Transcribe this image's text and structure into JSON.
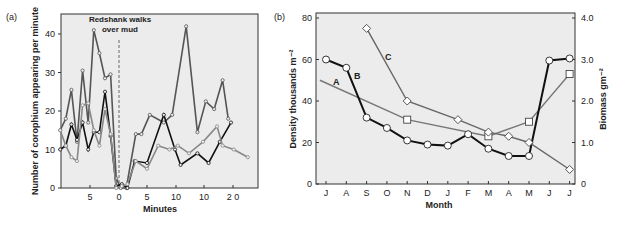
{
  "chart_data": [
    {
      "panel_label": "(a)",
      "type": "line",
      "title": "",
      "xlabel": "Minutes",
      "ylabel": "Number of corophium appearing per minute",
      "ylim": [
        0,
        45
      ],
      "yticks": [
        "0",
        "10",
        "20",
        "30",
        "40"
      ],
      "xticks": [
        "5",
        "0",
        "5",
        "10",
        "10",
        "2 0"
      ],
      "annotation": {
        "line1": "Redshank walks",
        "line2": "over mud",
        "x": 0
      },
      "grid": false,
      "series": [
        {
          "name": "series-1 (dark grey, highest)",
          "color": "#555555",
          "x": [
            -10.5,
            -9.5,
            -8.5,
            -7.5,
            -6.5,
            -5.5,
            -4.5,
            -3.5,
            -2.5,
            -1.5,
            -0.5,
            0.3,
            1.3,
            3,
            4,
            5.5,
            8,
            9.5,
            12,
            14,
            15.5,
            17,
            18.5,
            19.5
          ],
          "y": [
            15,
            18,
            25.5,
            12,
            30.5,
            17,
            41,
            35,
            28.5,
            29.5,
            2.5,
            0,
            0,
            14,
            14,
            19,
            17,
            19,
            42,
            14.5,
            22.5,
            20.5,
            28,
            18
          ]
        },
        {
          "name": "series-2 (black)",
          "color": "#111111",
          "x": [
            -10.5,
            -9.5,
            -8.5,
            -7.5,
            -6.5,
            -5.5,
            -4.5,
            -3.5,
            -2.5,
            -1.5,
            -0.5,
            0.5,
            1.5,
            2.8,
            5,
            8,
            10,
            11,
            14,
            16,
            18,
            20
          ],
          "y": [
            10,
            11,
            16.5,
            12.5,
            17,
            10,
            14.5,
            14.5,
            25,
            13.5,
            0.5,
            1,
            0,
            7,
            6.5,
            19,
            10,
            6,
            9,
            6.5,
            12,
            17
          ]
        },
        {
          "name": "series-3 (light grey)",
          "color": "#888888",
          "x": [
            -10.5,
            -9.5,
            -8.5,
            -7.5,
            -6.5,
            -5.5,
            -4.5,
            -3.5,
            -2.5,
            -1.5,
            -0.5,
            0.5,
            1.5,
            3,
            5,
            7,
            9,
            10.5,
            12.5,
            15,
            17.5,
            18.5,
            20.5,
            23
          ],
          "y": [
            15,
            11,
            8,
            7,
            21.5,
            22,
            15,
            11,
            20.5,
            14,
            0,
            0.5,
            1,
            7,
            5,
            11,
            10,
            11,
            9,
            12,
            16,
            11,
            10,
            8
          ]
        }
      ]
    },
    {
      "panel_label": "(b)",
      "type": "line",
      "title": "",
      "xlabel": "Month",
      "ylabel_left": "Density thousands m⁻²",
      "ylabel_right": "Biomass gm⁻²",
      "categories": [
        "J",
        "A",
        "S",
        "O",
        "N",
        "D",
        "J",
        "F",
        "M",
        "A",
        "M",
        "J",
        "J"
      ],
      "ylim_left": [
        0,
        80
      ],
      "ylim_right": [
        0,
        4.0
      ],
      "yticks_left": [
        "0",
        "20",
        "40",
        "60",
        "80"
      ],
      "yticks_right": [
        "0",
        "1.0",
        "2.0",
        "3.0",
        "4.0"
      ],
      "grid": false,
      "series": [
        {
          "name": "A",
          "marker": "square",
          "color": "#777777",
          "axis": "left",
          "x_index": [
            -0.3,
            4,
            8,
            10,
            12
          ],
          "values": [
            50,
            31,
            23,
            30,
            53
          ]
        },
        {
          "name": "B",
          "marker": "circle",
          "color": "#111111",
          "axis": "left",
          "x_index": [
            0,
            1,
            2,
            3,
            4,
            5,
            6,
            7,
            8,
            9,
            10,
            11,
            12
          ],
          "values": [
            60,
            56,
            32,
            27,
            21,
            19,
            18.5,
            24,
            17,
            13.5,
            13.5,
            59.5,
            60.5
          ]
        },
        {
          "name": "C",
          "marker": "diamond",
          "color": "#666666",
          "axis": "right",
          "x_index": [
            2,
            4,
            6.5,
            8,
            9,
            10,
            12
          ],
          "values": [
            3.75,
            2.0,
            1.55,
            1.25,
            1.15,
            1.0,
            0.35
          ]
        }
      ],
      "labels": {
        "A": "A",
        "B": "B",
        "C": "C"
      }
    }
  ]
}
